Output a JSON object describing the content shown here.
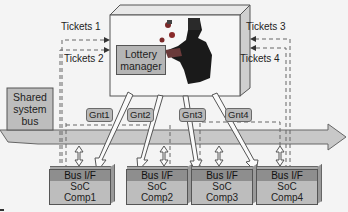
{
  "diagram": {
    "arbiter": {
      "label_line1": "Lottery",
      "label_line2": "manager"
    },
    "bus": {
      "label_line1": "Shared",
      "label_line2": "system",
      "label_line3": "bus"
    },
    "tickets": [
      {
        "label": "Tickets 1",
        "side": "left"
      },
      {
        "label": "Tickets 2",
        "side": "left"
      },
      {
        "label": "Tickets 3",
        "side": "right"
      },
      {
        "label": "Tickets 4",
        "side": "right"
      }
    ],
    "grants": [
      {
        "label": "Gnt1"
      },
      {
        "label": "Gnt2"
      },
      {
        "label": "Gnt3"
      },
      {
        "label": "Gnt4"
      }
    ],
    "components": [
      {
        "interface": "Bus I/F",
        "line1": "SoC",
        "line2": "Comp1"
      },
      {
        "interface": "Bus I/F",
        "line1": "SoC",
        "line2": "Comp2"
      },
      {
        "interface": "Bus I/F",
        "line1": "SoC",
        "line2": "Comp3"
      },
      {
        "interface": "Bus I/F",
        "line1": "SoC",
        "line2": "Comp4"
      }
    ],
    "colors": {
      "background": "#f4f4f4",
      "box_fill": "#bdbdbd",
      "header_fill": "#8e8e8e",
      "bus_fill": "#c4c4c4",
      "stroke": "#555555"
    }
  }
}
